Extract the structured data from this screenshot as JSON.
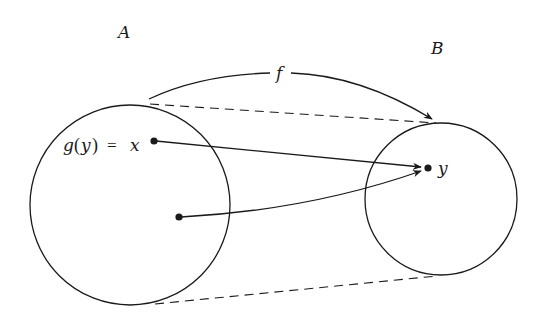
{
  "diagram": {
    "sets": [
      {
        "name": "A",
        "label": "A"
      },
      {
        "name": "B",
        "label": "B"
      }
    ],
    "function_label": "f",
    "point_x_label_g": "g",
    "point_x_label_paren_open": "(",
    "point_x_label_y": "y",
    "point_x_label_paren_close": ")",
    "point_x_label_eq": "=",
    "point_x_label_x": "x",
    "point_y_label": "y",
    "colors": {
      "stroke": "#1a1a1a",
      "background": "#ffffff"
    }
  }
}
